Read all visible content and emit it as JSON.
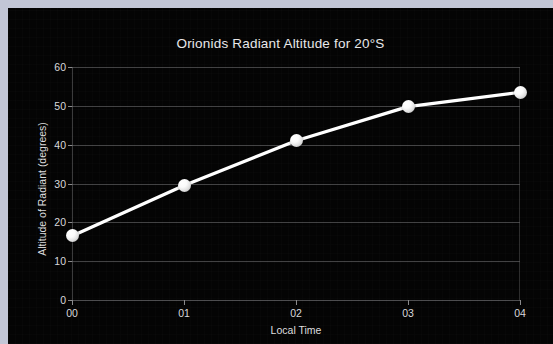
{
  "canvas": {
    "width": 553,
    "height": 344,
    "background": "#c2c6d6",
    "panel_background": "#040404"
  },
  "chart_data": {
    "type": "line",
    "title": "Orionids Radiant Altitude for 20°S",
    "xlabel": "Local Time",
    "ylabel": "Altitude of Radiant (degrees)",
    "categories": [
      "00",
      "01",
      "02",
      "03",
      "04"
    ],
    "values": [
      16.5,
      29.5,
      41.0,
      49.8,
      53.5
    ],
    "series": [
      {
        "name": "Altitude of Radiant",
        "values": [
          16.5,
          29.5,
          41.0,
          49.8,
          53.5
        ],
        "line_color": "#ffffff",
        "marker": "sphere",
        "marker_color": "#ffffff"
      }
    ],
    "ylim": [
      0,
      60
    ],
    "yticks": [
      0,
      10,
      20,
      30,
      40,
      50,
      60
    ],
    "ytick_labels": [
      "0",
      "10",
      "20",
      "30",
      "40",
      "50",
      "60"
    ],
    "xticks": [
      "00",
      "01",
      "02",
      "03",
      "04"
    ],
    "grid": "horizontal",
    "grid_color": "#5a5a5c",
    "legend": "none",
    "text_color": "#dededf"
  }
}
